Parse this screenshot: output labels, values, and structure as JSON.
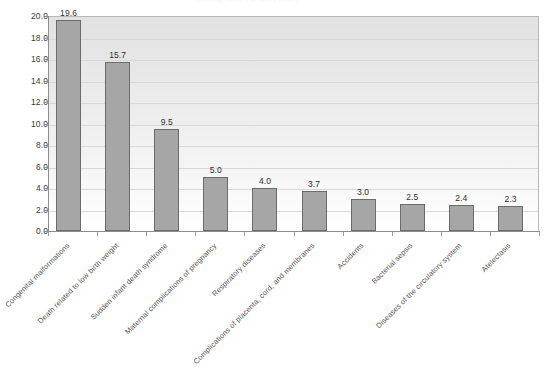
{
  "figure": {
    "title_ghost": "Leading causes of infant death",
    "background_color": "#ffffff"
  },
  "axes": {
    "y_tick_labels": [
      "20.0",
      "18.0",
      "16.0",
      "14.0",
      "12.0",
      "10.0",
      "8.0",
      "6.0",
      "4.0",
      "2.0",
      "0.0"
    ],
    "y_axis_color": "#8d8d8d",
    "grid_color": "#d8d8d8",
    "bar_fill_color": "#a6a6a6",
    "bar_border_color": "#6b6b6b"
  },
  "chart_data": {
    "type": "bar",
    "title": "Leading causes of infant death",
    "xlabel": "",
    "ylabel": "",
    "ylim": [
      0.0,
      20.0
    ],
    "ytick_step": 2.0,
    "grid": true,
    "legend": "none",
    "orientation": "vertical",
    "value_labels_shown": true,
    "categories": [
      "Congenital malformations",
      "Death related to low birth weight",
      "Sudden infant death syndrome",
      "Maternal complications of pregnancy",
      "Respiratory diseases",
      "Complications of placenta, cord, and membranes",
      "Accidents",
      "Bacterial sepsis",
      "Diseases of the circulatory system",
      "Atelectasis"
    ],
    "values": [
      19.6,
      15.7,
      9.5,
      5.0,
      4.0,
      3.7,
      3.0,
      2.5,
      2.4,
      2.3
    ],
    "value_labels": [
      "19.6",
      "15.7",
      "9.5",
      "5.0",
      "4.0",
      "3.7",
      "3.0",
      "2.5",
      "2.4",
      "2.3"
    ]
  }
}
